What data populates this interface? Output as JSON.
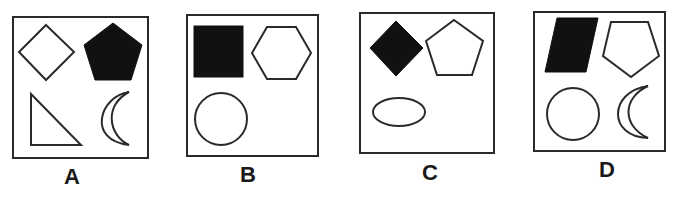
{
  "figure": {
    "type": "shape-reasoning-options",
    "header_text_visible": false
  },
  "colors": {
    "stroke": "#2a2a2a",
    "filled": "#111111",
    "background": "#ffffff"
  },
  "options": [
    {
      "label": "A",
      "shapes": [
        {
          "position": "top-left",
          "shape": "diamond",
          "filled": false
        },
        {
          "position": "top-right",
          "shape": "pentagon",
          "filled": true
        },
        {
          "position": "bottom-left",
          "shape": "right-triangle",
          "filled": false
        },
        {
          "position": "bottom-right",
          "shape": "crescent",
          "filled": false
        }
      ]
    },
    {
      "label": "B",
      "shapes": [
        {
          "position": "top-left",
          "shape": "square",
          "filled": true
        },
        {
          "position": "top-right",
          "shape": "hexagon",
          "filled": false
        },
        {
          "position": "bottom-left",
          "shape": "circle",
          "filled": false
        }
      ]
    },
    {
      "label": "C",
      "shapes": [
        {
          "position": "top-left",
          "shape": "diamond",
          "filled": true
        },
        {
          "position": "top-right",
          "shape": "pentagon",
          "filled": false
        },
        {
          "position": "bottom-left",
          "shape": "ellipse",
          "filled": false
        }
      ]
    },
    {
      "label": "D",
      "shapes": [
        {
          "position": "top-left",
          "shape": "parallelogram",
          "filled": true
        },
        {
          "position": "top-right",
          "shape": "inverted-pentagon",
          "filled": false
        },
        {
          "position": "bottom-left",
          "shape": "circle",
          "filled": false
        },
        {
          "position": "bottom-right",
          "shape": "crescent",
          "filled": false
        }
      ]
    }
  ]
}
